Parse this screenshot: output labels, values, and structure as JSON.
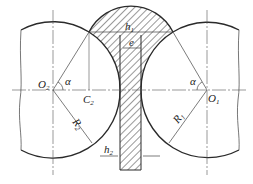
{
  "diagram": {
    "type": "rolling/welding cross-section geometry",
    "labels": {
      "o2": "O",
      "o2_sub": "2",
      "o1": "O",
      "o1_sub": "1",
      "c2": "C",
      "c2_sub": "2",
      "alpha_left": "α",
      "alpha_right": "α",
      "r2": "R",
      "r2_sub": "2",
      "r1": "R",
      "r1_sub": "1",
      "h1": "h",
      "h1_sub": "1",
      "h2": "h",
      "h2_sub": "2",
      "e": "e"
    },
    "colors": {
      "stroke": "#2a2a2a",
      "thin": "#555555",
      "background": "#ffffff"
    }
  }
}
